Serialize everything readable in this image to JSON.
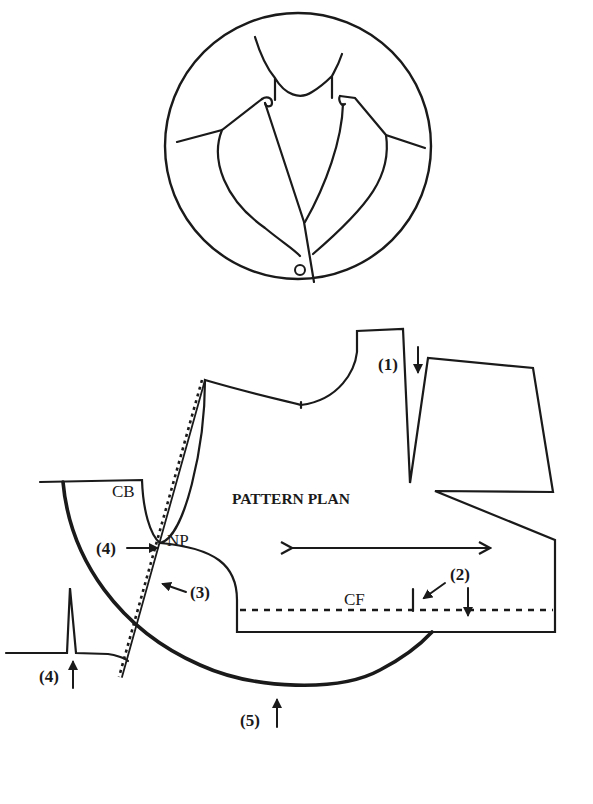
{
  "illustration": {
    "description": "Circular inset showing jacket front with notched-less shawl style lapel collar and one button"
  },
  "pattern": {
    "title": "PATTERN PLAN",
    "labels": {
      "cb": "CB",
      "np": "NP",
      "cf": "CF"
    },
    "markers": {
      "m1": "(1)",
      "m2": "(2)",
      "m3": "(3)",
      "m4a": "(4)",
      "m4b": "(4)",
      "m5": "(5)"
    }
  },
  "colors": {
    "ink": "#1a1a1a",
    "paper": "#ffffff"
  }
}
